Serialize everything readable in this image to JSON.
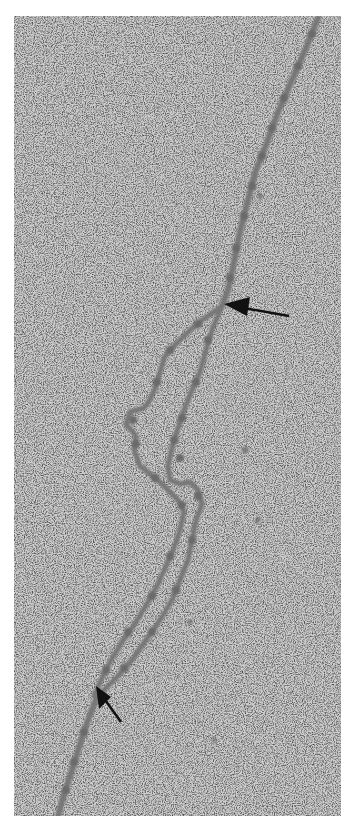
{
  "figure": {
    "type": "electron-micrograph",
    "background_color": "#c9c9c9",
    "strand_color": "#6e6e6e",
    "arrow_color": "#111111",
    "arrows": [
      {
        "name": "upper-arrow",
        "tip": [
          224,
          304
        ],
        "tail": [
          289,
          316
        ]
      },
      {
        "name": "lower-arrow",
        "tip": [
          96,
          700
        ],
        "tail": [
          121,
          722
        ]
      }
    ]
  }
}
